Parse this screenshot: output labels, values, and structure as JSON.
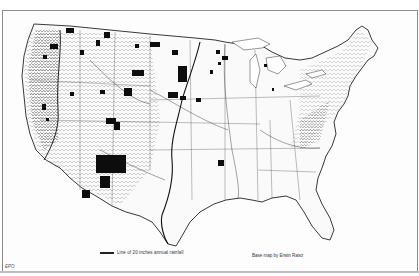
{
  "map": {
    "subject": "Contiguous United States base map",
    "legend": {
      "rainfall_line_label": "Line of 20 inches annual rainfall"
    },
    "credit": "Base map by Erwin Raisz",
    "corner_mark": "EPO",
    "colors": {
      "background": "#ffffff",
      "ink": "#1a1a1a",
      "frame": "#8a8a8a",
      "filled_areas": "#0d0d0d"
    }
  }
}
